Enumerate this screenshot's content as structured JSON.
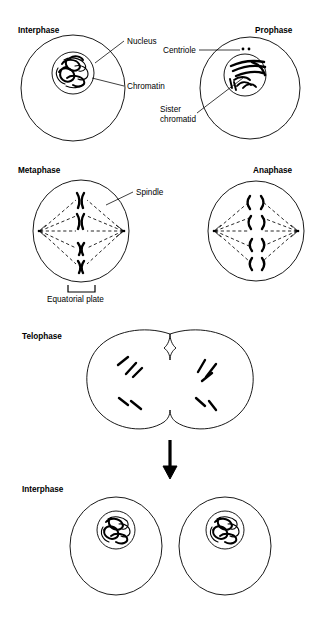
{
  "figure": {
    "background_color": "#ffffff",
    "ink_color": "#000000",
    "width": 323,
    "height": 619
  },
  "panels": {
    "interphase_top": {
      "heading": "Interphase",
      "heading_pos": {
        "x": 18,
        "y": 33
      },
      "cell": {
        "cx": 73,
        "cy": 88,
        "rx": 52,
        "ry": 53
      },
      "nucleus": {
        "cx": 73,
        "cy": 73,
        "rx": 21,
        "ry": 21
      },
      "content_description": "tangled chromatin threads"
    },
    "prophase": {
      "heading": "Prophase",
      "heading_pos": {
        "x": 255,
        "y": 33
      },
      "cell": {
        "cx": 250,
        "cy": 88,
        "rx": 50,
        "ry": 51
      },
      "nucleus": {
        "cx": 245,
        "cy": 75,
        "rx": 21,
        "ry": 21
      },
      "centriole_dots": [
        {
          "x": 243,
          "y": 49
        },
        {
          "x": 249,
          "y": 49
        }
      ],
      "content_description": "condensed chromosomes with sister chromatids"
    },
    "metaphase": {
      "heading": "Metaphase",
      "heading_pos": {
        "x": 18,
        "y": 173
      },
      "cell": {
        "cx": 81,
        "cy": 231,
        "rx": 48,
        "ry": 51
      },
      "poles": [
        {
          "x": 39,
          "y": 231
        },
        {
          "x": 124,
          "y": 231
        }
      ],
      "chromosome_count": 4,
      "content_description": "four X-shaped chromosomes aligned on the equatorial plate with dashed spindle fibers"
    },
    "anaphase": {
      "heading": "Anaphase",
      "heading_pos": {
        "x": 253,
        "y": 173
      },
      "cell": {
        "cx": 256,
        "cy": 231,
        "rx": 48,
        "ry": 50
      },
      "poles": [
        {
          "x": 214,
          "y": 231
        },
        {
          "x": 298,
          "y": 231
        }
      ],
      "chromatid_pair_count": 4,
      "content_description": "sister chromatids separating toward opposite poles"
    },
    "telophase": {
      "heading": "Telophase",
      "heading_pos": {
        "x": 22,
        "y": 339
      },
      "cell": {
        "cx": 170,
        "cy": 382,
        "rx": 82,
        "ry": 57
      },
      "content_description": "dumbbell-shaped cell with cleavage furrow and two chromosome clusters"
    },
    "interphase_bottom": {
      "heading": "Interphase",
      "heading_pos": {
        "x": 22,
        "y": 492
      },
      "cells": [
        {
          "cell": {
            "cx": 116,
            "cy": 546,
            "rx": 46,
            "ry": 49
          },
          "nucleus": {
            "cx": 116,
            "cy": 530,
            "rx": 19,
            "ry": 19
          }
        },
        {
          "cell": {
            "cx": 225,
            "cy": 546,
            "rx": 46,
            "ry": 49
          },
          "nucleus": {
            "cx": 225,
            "cy": 530,
            "rx": 19,
            "ry": 19
          }
        }
      ],
      "content_description": "two daughter cells each with a nucleus containing chromatin"
    }
  },
  "annotations": {
    "nucleus": {
      "label": "Nucleus",
      "text_pos": {
        "x": 127,
        "y": 44
      },
      "leader": "M 124 41 L 95 63"
    },
    "chromatin": {
      "label": "Chromatin",
      "text_pos": {
        "x": 127,
        "y": 89
      },
      "leader": "M 124 86 L 92 78"
    },
    "centriole": {
      "label": "Centriole",
      "text_pos": {
        "x": 163,
        "y": 53
      },
      "leader": "M 199 50 L 240 50"
    },
    "sister_chromatid": {
      "label_line1": "Sister",
      "label_line2": "chromatid",
      "text_pos": {
        "x": 160,
        "y": 112
      },
      "leader": "M 197 113 L 243 78"
    },
    "spindle": {
      "label": "Spindle",
      "text_pos": {
        "x": 136,
        "y": 195
      },
      "leader": "M 133 192 L 106 205"
    },
    "equatorial_plate": {
      "label": "Equatorial plate",
      "text_pos": {
        "x": 47,
        "y": 302
      },
      "bracket": "M 68 285 L 68 292 L 95 292 L 95 285"
    }
  },
  "flow_arrow": {
    "name": "downward-arrow",
    "from": {
      "x": 170,
      "y": 440
    },
    "to": {
      "x": 170,
      "y": 478
    }
  }
}
